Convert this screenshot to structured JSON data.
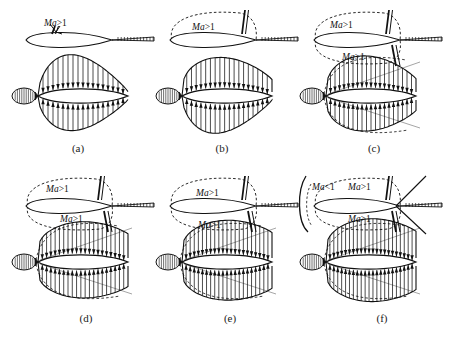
{
  "figure": {
    "title": "",
    "background_color": "#ffffff",
    "ink_color": "#111111",
    "panel_count": 6,
    "columns": 3,
    "rows": 2
  },
  "labels": {
    "supersonic": "Ma>1",
    "subsonic": "Ma<1"
  },
  "panels": [
    {
      "id": "a",
      "caption": "(a)",
      "x": 8,
      "y": 4,
      "w": 140,
      "h": 162,
      "caption_x": 48,
      "caption_y": 142,
      "stage": "incipient-shock",
      "airfoil": {
        "has_upper_sonic_bubble": false,
        "has_lower_sonic_bubble": false,
        "upper_shock": true,
        "lower_shock": false,
        "bow_shock": false,
        "label_texts": [
          "Ma>1"
        ],
        "label_positions": [
          {
            "x": 36,
            "y": 14
          }
        ],
        "pointer_line": true
      },
      "pressure": {
        "upper_peak": 0.72,
        "lower_peak": 0.6,
        "trailing_cut": false,
        "diagonal_chords": 0,
        "upper_shape": "rounded-peak",
        "lower_shape": "rounded-peak",
        "arrow_count_upper": 17,
        "arrow_count_lower": 17
      }
    },
    {
      "id": "b",
      "caption": "(b)",
      "x": 152,
      "y": 4,
      "w": 140,
      "h": 162,
      "caption_x": 192,
      "caption_y": 142,
      "stage": "upper-supersonic-pocket",
      "airfoil": {
        "has_upper_sonic_bubble": true,
        "has_lower_sonic_bubble": false,
        "upper_shock": true,
        "lower_shock": false,
        "bow_shock": false,
        "label_texts": [
          "Ma>1"
        ],
        "label_positions": [
          {
            "x": 40,
            "y": 18
          }
        ],
        "pointer_line": false
      },
      "pressure": {
        "upper_peak": 0.78,
        "lower_peak": 0.66,
        "trailing_cut": true,
        "diagonal_chords": 0,
        "upper_shape": "shoulder",
        "lower_shape": "rounded-peak",
        "arrow_count_upper": 18,
        "arrow_count_lower": 18
      }
    },
    {
      "id": "c",
      "caption": "(c)",
      "x": 296,
      "y": 4,
      "w": 148,
      "h": 162,
      "caption_x": 344,
      "caption_y": 142,
      "stage": "both-surfaces-supersonic",
      "airfoil": {
        "has_upper_sonic_bubble": true,
        "has_lower_sonic_bubble": true,
        "upper_shock": true,
        "lower_shock": true,
        "bow_shock": false,
        "label_texts": [
          "Ma>1",
          "Ma>1"
        ],
        "label_positions": [
          {
            "x": 34,
            "y": 16
          },
          {
            "x": 46,
            "y": 48
          }
        ],
        "pointer_line": false
      },
      "pressure": {
        "upper_peak": 0.82,
        "lower_peak": 0.72,
        "trailing_cut": true,
        "diagonal_chords": 2,
        "upper_shape": "shoulder",
        "lower_shape": "shoulder",
        "arrow_count_upper": 19,
        "arrow_count_lower": 19
      }
    },
    {
      "id": "d",
      "caption": "(d)",
      "x": 8,
      "y": 170,
      "w": 140,
      "h": 165,
      "caption_x": 56,
      "caption_y": 312,
      "stage": "shocks-moving-aft",
      "airfoil": {
        "has_upper_sonic_bubble": true,
        "has_lower_sonic_bubble": true,
        "upper_shock": true,
        "lower_shock": true,
        "bow_shock": false,
        "label_texts": [
          "Ma>1",
          "Ma>1"
        ],
        "label_positions": [
          {
            "x": 38,
            "y": 14
          },
          {
            "x": 52,
            "y": 44
          }
        ],
        "pointer_line": false
      },
      "pressure": {
        "upper_peak": 0.86,
        "lower_peak": 0.78,
        "trailing_cut": true,
        "diagonal_chords": 2,
        "upper_shape": "flat-top",
        "lower_shape": "flat-top",
        "arrow_count_upper": 20,
        "arrow_count_lower": 20
      }
    },
    {
      "id": "e",
      "caption": "(e)",
      "x": 152,
      "y": 170,
      "w": 140,
      "h": 165,
      "caption_x": 200,
      "caption_y": 312,
      "stage": "shocks-at-trailing-edge",
      "airfoil": {
        "has_upper_sonic_bubble": true,
        "has_lower_sonic_bubble": true,
        "upper_shock": true,
        "lower_shock": true,
        "bow_shock": false,
        "label_texts": [
          "Ma>1",
          "Ma>1"
        ],
        "label_positions": [
          {
            "x": 44,
            "y": 18
          },
          {
            "x": 46,
            "y": 50
          }
        ],
        "pointer_line": false
      },
      "pressure": {
        "upper_peak": 0.9,
        "lower_peak": 0.84,
        "trailing_cut": true,
        "diagonal_chords": 2,
        "upper_shape": "flat-top",
        "lower_shape": "flat-top",
        "arrow_count_upper": 21,
        "arrow_count_lower": 21
      }
    },
    {
      "id": "f",
      "caption": "(f)",
      "x": 296,
      "y": 170,
      "w": 148,
      "h": 165,
      "caption_x": 352,
      "caption_y": 312,
      "stage": "detached-bow-shock",
      "airfoil": {
        "has_upper_sonic_bubble": true,
        "has_lower_sonic_bubble": true,
        "upper_shock": true,
        "lower_shock": true,
        "bow_shock": true,
        "label_texts": [
          "Ma<1",
          "Ma>1",
          "Ma>1"
        ],
        "label_positions": [
          {
            "x": 16,
            "y": 12
          },
          {
            "x": 52,
            "y": 12
          },
          {
            "x": 52,
            "y": 44
          }
        ],
        "pointer_line": false
      },
      "pressure": {
        "upper_peak": 0.94,
        "lower_peak": 0.88,
        "trailing_cut": true,
        "diagonal_chords": 2,
        "upper_shape": "flat-top",
        "lower_shape": "flat-top",
        "arrow_count_upper": 22,
        "arrow_count_lower": 22
      }
    }
  ]
}
